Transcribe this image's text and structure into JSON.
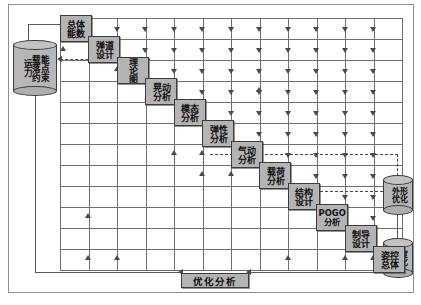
{
  "diagram": {
    "type": "design-structure-matrix",
    "colors": {
      "node_fill": "#b4b4b4",
      "node_border": "#3d3d3d",
      "grid_line": "#6f6f6f",
      "frame": "#8e8e8e",
      "connector": "#5a5a5a",
      "background": "#ffffff"
    },
    "datastores": [
      {
        "id": "ds-capability",
        "label": "运载能力落点约束",
        "label_columns": [
          "能点束",
          "载落约",
          "运力"
        ],
        "position": "left"
      },
      {
        "id": "ds-shape-opt",
        "label": "外形优化",
        "label_columns": [
          "形化",
          "外优"
        ],
        "position": "right-upper"
      },
      {
        "id": "ds-accuracy-opt",
        "label": "精度优化",
        "label_columns": [
          "度化",
          "精优"
        ],
        "position": "right-lower"
      }
    ],
    "nodes": [
      {
        "id": "n1",
        "label": "总体性能数据",
        "label_columns": [
          "体数",
          "总能"
        ],
        "col": 0,
        "orientation": "vertical"
      },
      {
        "id": "n2",
        "label": "弹道设计",
        "label_columns": [
          "道计",
          "弹设"
        ],
        "col": 1,
        "orientation": "vertical"
      },
      {
        "id": "n3",
        "label": "理论图",
        "label_columns": [
          "理论图"
        ],
        "col": 2,
        "orientation": "vertical"
      },
      {
        "id": "n4",
        "label": "晃动分析",
        "label_columns": [
          "动析",
          "晃分"
        ],
        "col": 3,
        "orientation": "vertical"
      },
      {
        "id": "n5",
        "label": "模态分析",
        "label_columns": [
          "态析",
          "模分"
        ],
        "col": 4,
        "orientation": "vertical"
      },
      {
        "id": "n6",
        "label": "弹性分析",
        "label_columns": [
          "性析",
          "弹分"
        ],
        "col": 5,
        "orientation": "vertical"
      },
      {
        "id": "n7",
        "label": "气动分析",
        "label_columns": [
          "动析",
          "气分"
        ],
        "col": 6,
        "orientation": "vertical"
      },
      {
        "id": "n8",
        "label": "载荷分析",
        "label_columns": [
          "荷析",
          "载分"
        ],
        "col": 7,
        "orientation": "vertical"
      },
      {
        "id": "n9",
        "label": "结构设计",
        "label_columns": [
          "构计",
          "结设"
        ],
        "col": 8,
        "orientation": "vertical"
      },
      {
        "id": "n10",
        "label": "POGO分析",
        "label_columns": [
          "POGO",
          "分析"
        ],
        "col": 9,
        "orientation": "horizontal"
      },
      {
        "id": "n11",
        "label": "制导设计",
        "label_columns": [
          "导计",
          "制设"
        ],
        "col": 10,
        "orientation": "vertical"
      },
      {
        "id": "n12",
        "label": "姿控总体",
        "label_columns": [
          "控体",
          "姿总"
        ],
        "col": 11,
        "orientation": "vertical"
      }
    ],
    "bottom_bar": {
      "id": "opt-analysis",
      "label": "优化分析"
    },
    "grid": {
      "rows": 12,
      "cols": 12,
      "show_lines": true,
      "arrow_direction_vertical": "down",
      "arrow_direction_horizontal": "left"
    }
  }
}
